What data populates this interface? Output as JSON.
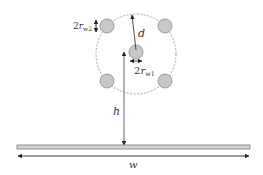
{
  "figure": {
    "colors": {
      "wire_fill": "#c8c8c8",
      "wire_stroke": "#8a8a8a",
      "line": "#3a3a3a",
      "dashed_circle": "#8a8a8a",
      "ground_fill": "#d4d4d4",
      "ground_stroke": "#7a7a7a",
      "text": "#333333"
    },
    "labels": {
      "outer_wire_diameter": {
        "prefix": "2",
        "var": "r",
        "sub": "w2"
      },
      "center_wire_diameter": {
        "prefix": "2",
        "var": "r",
        "sub": "w1"
      },
      "spacing": "d",
      "height": "h",
      "width": "w"
    },
    "elements": {
      "dashed_circle": {
        "cx": 136,
        "cy": 54,
        "r": 40
      },
      "wires": [
        {
          "name": "center-wire",
          "cx": 136,
          "cy": 52,
          "r": 7
        },
        {
          "name": "outer-wire-top-left",
          "cx": 107,
          "cy": 26,
          "r": 7
        },
        {
          "name": "outer-wire-top-right",
          "cx": 165,
          "cy": 26,
          "r": 7
        },
        {
          "name": "outer-wire-bottom-left",
          "cx": 107,
          "cy": 81,
          "r": 7
        },
        {
          "name": "outer-wire-bottom-right",
          "cx": 165,
          "cy": 81,
          "r": 7
        }
      ],
      "ground_strip": {
        "x": 17,
        "y": 145,
        "width": 233,
        "height": 4
      }
    }
  }
}
